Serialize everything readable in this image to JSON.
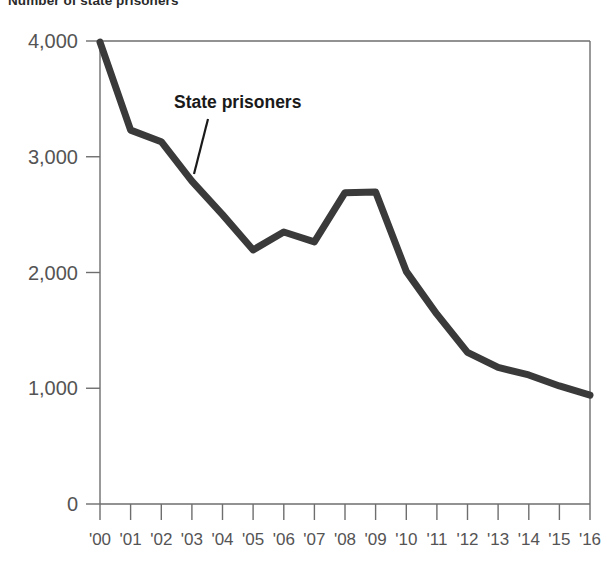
{
  "chart_data": {
    "type": "line",
    "title": "Number of state prisoners",
    "xlabel": "",
    "ylabel": "",
    "grid": false,
    "legend_position": "inline-annotation",
    "x": [
      "'00",
      "'01",
      "'02",
      "'03",
      "'04",
      "'05",
      "'06",
      "'07",
      "'08",
      "'09",
      "'10",
      "'11",
      "'12",
      "'13",
      "'14",
      "'15",
      "'16"
    ],
    "xtick_labels": [
      "'00",
      "'01",
      "'02",
      "'03",
      "'04",
      "'05",
      "'06",
      "'07",
      "'08",
      "'09",
      "'10",
      "'11",
      "'12",
      "'13",
      "'14",
      "'15",
      "'16"
    ],
    "ytick_labels": [
      "4,000",
      "3,000",
      "2,000",
      "1,000",
      "0"
    ],
    "ytick_values": [
      4000,
      3000,
      2000,
      1000,
      0
    ],
    "ylim": [
      0,
      4000
    ],
    "series": [
      {
        "name": "State prisoners",
        "color": "#3a3a3a",
        "values": [
          3990,
          3230,
          3130,
          2790,
          2500,
          2195,
          2350,
          2265,
          2690,
          2695,
          2010,
          1640,
          1310,
          1180,
          1115,
          1020,
          940
        ]
      }
    ],
    "annotations": [
      {
        "text": "State prisoners",
        "target_x": "'03",
        "target_y": 2860
      }
    ]
  },
  "axis": {
    "y_labels": [
      "4,000",
      "3,000",
      "2,000",
      "1,000",
      "0"
    ],
    "x_labels": [
      "'00",
      "'01",
      "'02",
      "'03",
      "'04",
      "'05",
      "'06",
      "'07",
      "'08",
      "'09",
      "'10",
      "'11",
      "'12",
      "'13",
      "'14",
      "'15",
      "'16"
    ]
  },
  "colors": {
    "line": "#3a3a3a",
    "axis": "#6e6e6e",
    "text": "#555454",
    "annotation": "#1a1a1a"
  }
}
